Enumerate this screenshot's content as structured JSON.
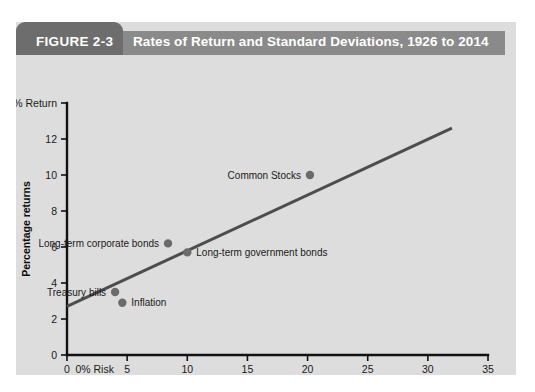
{
  "figure": {
    "number": "FIGURE 2-3",
    "title": "Rates of Return and Standard Deviations, 1926 to 2014"
  },
  "colors": {
    "panel_background": "#dddddd",
    "header_bar": "#8a8a8a",
    "header_tab": "#6d6d6d",
    "header_text": "#ffffff",
    "axis": "#111111",
    "trend_line": "#4d4d4d",
    "marker": "#6b6b6b",
    "text": "#1a1a1a"
  },
  "chart_data": {
    "type": "scatter",
    "title": "Rates of Return and Standard Deviations, 1926 to 2014",
    "xlabel": "Standard deviation of returns",
    "ylabel": "Percentage returns",
    "xlim": [
      0,
      35
    ],
    "ylim": [
      0,
      14
    ],
    "xticks": [
      0,
      5,
      10,
      15,
      20,
      25,
      30,
      35
    ],
    "xtick_labels": [
      "0",
      "5",
      "10",
      "15",
      "20",
      "25",
      "30",
      "35"
    ],
    "yticks": [
      0,
      2,
      4,
      6,
      8,
      10,
      12,
      14
    ],
    "ytick_labels": [
      "0",
      "2",
      "4",
      "6",
      "8",
      "10",
      "12",
      "14% Return"
    ],
    "y_top_label": "14% Return",
    "x_origin_label": "0% Risk",
    "grid": false,
    "legend": "none",
    "points": [
      {
        "label": "Common Stocks",
        "x": 20.2,
        "y": 10.0,
        "label_side": "left"
      },
      {
        "label": "Long-term government bonds",
        "x": 10.0,
        "y": 5.7,
        "label_side": "right"
      },
      {
        "label": "Long-term corporate bonds",
        "x": 8.4,
        "y": 6.2,
        "label_side": "left"
      },
      {
        "label": "Inflation",
        "x": 4.6,
        "y": 2.9,
        "label_side": "right"
      },
      {
        "label": "Treasury bills",
        "x": 4.0,
        "y": 3.5,
        "label_side": "left"
      }
    ],
    "trend_line": {
      "label": "Capital market line",
      "x_start": 0,
      "y_start": 2.7,
      "x_end": 32.0,
      "y_end": 12.6
    }
  }
}
